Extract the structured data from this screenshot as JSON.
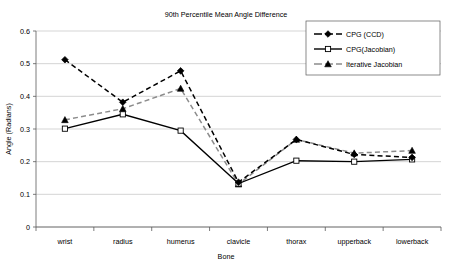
{
  "chart_data": {
    "type": "line",
    "title": "90th Percentile Mean Angle Difference",
    "xlabel": "Bone",
    "ylabel": "Angle (Radians)",
    "categories": [
      "wrist",
      "radius",
      "humerus",
      "clavicle",
      "thorax",
      "upperback",
      "lowerback"
    ],
    "ylim": [
      0,
      0.6
    ],
    "yticks": [
      "0",
      "0.1",
      "0.2",
      "0.3",
      "0.4",
      "0.5",
      "0.6"
    ],
    "ytick_values": [
      0,
      0.1,
      0.2,
      0.3,
      0.4,
      0.5,
      0.6
    ],
    "grid": "horizontal",
    "legend_position": "top-right",
    "series": [
      {
        "name": "CPG (CCD)",
        "values": [
          0.512,
          0.382,
          0.478,
          0.137,
          0.268,
          0.222,
          0.213
        ],
        "marker": "diamond",
        "line_style": "dashed",
        "color": "#000000"
      },
      {
        "name": "CPG(Jacobian)",
        "values": [
          0.301,
          0.345,
          0.295,
          0.133,
          0.203,
          0.2,
          0.207
        ],
        "marker": "square-open",
        "line_style": "solid",
        "color": "#000000"
      },
      {
        "name": "Iterative Jacobian",
        "values": [
          0.328,
          0.362,
          0.424,
          0.131,
          0.268,
          0.226,
          0.234
        ],
        "marker": "triangle",
        "line_style": "dashed",
        "color": "#8c8c8c"
      }
    ]
  },
  "colors": {
    "background": "#ffffff",
    "grid": "#b8b8b8",
    "axis": "#5a5a5a",
    "series_dark": "#000000",
    "series_gray": "#8c8c8c"
  }
}
